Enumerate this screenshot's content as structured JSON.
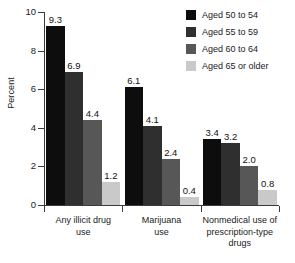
{
  "chart_data": {
    "type": "bar",
    "title": "",
    "xlabel": "",
    "ylabel": "Percent",
    "ylim": [
      0,
      10
    ],
    "yticks": [
      0,
      2,
      4,
      6,
      8,
      10
    ],
    "ytick_labels": [
      "0",
      "2",
      "4",
      "6",
      "8",
      "10"
    ],
    "grid": false,
    "legend_position": "top-right",
    "value_labels": true,
    "categories": [
      "Any illicit drug use",
      "Marijuana use",
      "Nonmedical use of prescription-type drugs"
    ],
    "category_lines": [
      [
        "Any illicit drug",
        "use"
      ],
      [
        "Marijuana",
        "use"
      ],
      [
        "Nonmedical use of",
        "prescription-type",
        "drugs"
      ]
    ],
    "series": [
      {
        "name": "Aged 50 to 54",
        "color": "#0d0d0d",
        "values": [
          9.3,
          6.1,
          3.4
        ],
        "labels": [
          "9.3",
          "6.1",
          "3.4"
        ]
      },
      {
        "name": "Aged 55 to 59",
        "color": "#2f2f2f",
        "values": [
          6.9,
          4.1,
          3.2
        ],
        "labels": [
          "6.9",
          "4.1",
          "3.2"
        ]
      },
      {
        "name": "Aged 60 to 64",
        "color": "#575757",
        "values": [
          4.4,
          2.4,
          2.0
        ],
        "labels": [
          "4.4",
          "2.4",
          "2.0"
        ]
      },
      {
        "name": "Aged 65 or older",
        "color": "#c9c9c9",
        "values": [
          1.2,
          0.4,
          0.8
        ],
        "labels": [
          "1.2",
          "0.4",
          "0.8"
        ]
      }
    ]
  },
  "axis": {
    "color": "#3b3b3b"
  }
}
